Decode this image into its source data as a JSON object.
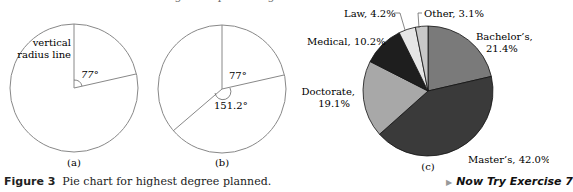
{
  "top_cut_text": "…degree … percentages.",
  "figure": {
    "caption_label": "Figure 3",
    "caption_text": "Pie chart for highest degree planned.",
    "now_try": "Now Try Exercise 7",
    "panel_a": {
      "label": "(a)",
      "annotation_line1": "vertical",
      "annotation_line2": "radius line",
      "angle_label": "77°"
    },
    "panel_b": {
      "label": "(b)",
      "angle1_label": "77°",
      "angle2_label": "151.2°"
    },
    "panel_c": {
      "label": "(c)"
    }
  },
  "chart_data": [
    {
      "type": "diagram",
      "title": "(a)",
      "description": "Circle with vertical radius line and a 77° sector drawn clockwise",
      "angles_deg": [
        77
      ]
    },
    {
      "type": "diagram",
      "title": "(b)",
      "description": "Circle with sectors of 77° and 151.2° drawn clockwise from vertical",
      "angles_deg": [
        77,
        151.2
      ]
    },
    {
      "type": "pie",
      "title": "(c) Highest degree planned",
      "categories": [
        "Bachelor's",
        "Master's",
        "Doctorate",
        "Medical",
        "Law",
        "Other"
      ],
      "values": [
        21.4,
        42.0,
        19.1,
        10.2,
        4.2,
        3.1
      ],
      "labels": [
        "Bachelor's, 21.4%",
        "Master's, 42.0%",
        "Doctorate, 19.1%",
        "Medical, 10.2%",
        "Law, 4.2%",
        "Other, 3.1%"
      ],
      "colors": [
        "#7a7a7a",
        "#3a3a3a",
        "#a8a8a8",
        "#1e1e1e",
        "#e6e6e6",
        "#c8c8c8"
      ],
      "start_angle": "12 o'clock, clockwise"
    }
  ]
}
